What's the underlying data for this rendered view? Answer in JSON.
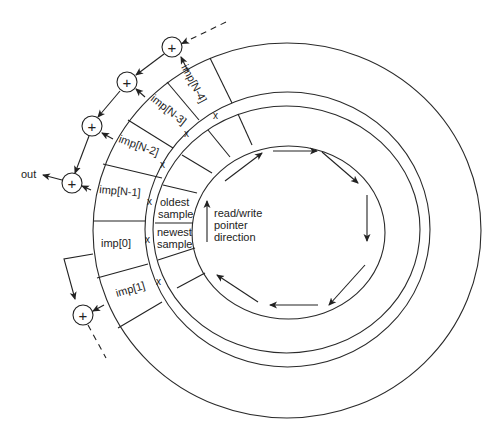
{
  "diagram": {
    "output_label": "out",
    "pointer_label": {
      "line1": "read/write",
      "line2": "pointer",
      "line3": "direction"
    },
    "coefficient_cells": [
      {
        "label": "imp[N-4]"
      },
      {
        "label": "imp[N-3]"
      },
      {
        "label": "imp[N-2]"
      },
      {
        "label": "imp[N-1]"
      },
      {
        "label": "imp[0]"
      },
      {
        "label": "imp[1]"
      }
    ],
    "sample_cells": {
      "oldest": {
        "line1": "oldest",
        "line2": "sample"
      },
      "newest": {
        "line1": "newest",
        "line2": "sample"
      }
    },
    "multiply_symbol": "x",
    "adder_symbol": "+",
    "adders_count": 5,
    "colors": {
      "stroke": "#222222",
      "background": "#ffffff"
    }
  }
}
